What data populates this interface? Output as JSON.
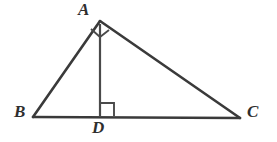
{
  "figure": {
    "name": "right-triangle-with-altitude",
    "background_color": "#ffffff",
    "stroke_color": "#3a3a3a",
    "label_color": "#2e2e2e",
    "width": 277,
    "height": 142
  },
  "labels": {
    "vertex_a": "A",
    "vertex_b": "B",
    "vertex_c": "C",
    "vertex_d": "D"
  },
  "chart_data": {
    "type": "diagram",
    "title": "",
    "points": [
      {
        "name": "A",
        "x": 100,
        "y": 21
      },
      {
        "name": "B",
        "x": 33,
        "y": 117
      },
      {
        "name": "C",
        "x": 240,
        "y": 118
      },
      {
        "name": "D",
        "x": 100,
        "y": 117
      }
    ],
    "segments": [
      {
        "name": "AB",
        "from": "A",
        "to": "B",
        "stroke_width": 2.6
      },
      {
        "name": "AC",
        "from": "A",
        "to": "C",
        "stroke_width": 2.6
      },
      {
        "name": "BC",
        "from": "B",
        "to": "C",
        "stroke_width": 2.6
      },
      {
        "name": "AD",
        "from": "A",
        "to": "D",
        "stroke_width": 2.2
      }
    ],
    "right_angle_markers": [
      {
        "name": "angle-BAC",
        "at": "A",
        "style": "rotated-square",
        "size": 13
      },
      {
        "name": "angle-ADC",
        "at": "D",
        "style": "square",
        "size": 14,
        "side": "right"
      }
    ]
  }
}
